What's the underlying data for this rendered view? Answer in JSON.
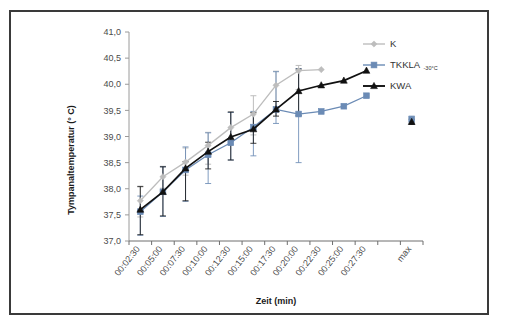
{
  "chart_data": {
    "type": "line",
    "title": "",
    "xlabel": "Zeit (min)",
    "ylabel": "Tympanaltemperatur (° C)",
    "ylim": [
      37.0,
      41.0
    ],
    "ytick_step": 0.5,
    "ytick_labels": [
      "37,0",
      "37,5",
      "38,0",
      "38,5",
      "39,0",
      "39,5",
      "40,0",
      "40,5",
      "41,0"
    ],
    "ytick_values": [
      37.0,
      37.5,
      38.0,
      38.5,
      39.0,
      39.5,
      40.0,
      40.5,
      41.0
    ],
    "categories": [
      "00:02:30",
      "00:05:00",
      "00:07:30",
      "00:10:00",
      "00:12:30",
      "00:15:00",
      "00:17:30",
      "00:20:00",
      "00:22:30",
      "00:25:00",
      "00:27:30",
      "",
      "max"
    ],
    "grid": false,
    "legend_position": "top-right",
    "series": [
      {
        "name": "K",
        "color": "#bdbdbd",
        "marker": "diamond",
        "values": [
          37.77,
          38.23,
          38.51,
          38.83,
          39.17,
          39.43,
          39.98,
          40.26,
          40.28,
          null,
          null,
          null,
          null
        ],
        "err_low": [
          0.31,
          0.22,
          0.25,
          0.36,
          0.33,
          0.4,
          0.52,
          0.36,
          null,
          null,
          null,
          null,
          null
        ],
        "err_high": [
          0.28,
          0.2,
          0.27,
          0.25,
          0.29,
          0.35,
          0.27,
          0.1,
          null,
          null,
          null,
          null,
          null
        ]
      },
      {
        "name": "TKKLA",
        "name_sub": "-30°C",
        "color": "#6b8bb5",
        "marker": "square",
        "values": [
          37.56,
          37.94,
          38.36,
          38.65,
          38.88,
          39.18,
          39.52,
          39.43,
          39.48,
          39.58,
          39.78,
          null,
          39.33
        ],
        "err_low": [
          0.45,
          0.47,
          0.6,
          0.55,
          0.33,
          0.55,
          0.27,
          0.93,
          null,
          null,
          null,
          null,
          0.07
        ],
        "err_high": [
          0.3,
          0.48,
          0.44,
          0.42,
          0.58,
          0.3,
          0.72,
          0.87,
          null,
          null,
          null,
          null,
          0.06
        ]
      },
      {
        "name": "KWA",
        "color": "#111111",
        "marker": "triangle",
        "values": [
          37.6,
          37.94,
          38.39,
          38.71,
          38.99,
          39.14,
          39.52,
          39.87,
          39.98,
          40.07,
          40.26,
          null,
          39.28
        ],
        "err_low": [
          0.48,
          0.46,
          0.62,
          0.33,
          0.44,
          0.27,
          0.13,
          0.47,
          null,
          null,
          null,
          null,
          0.05
        ],
        "err_high": [
          0.44,
          0.48,
          0.13,
          0.18,
          0.48,
          0.32,
          0.15,
          0.42,
          null,
          null,
          null,
          null,
          0.05
        ]
      }
    ]
  },
  "legend": {
    "items": [
      {
        "label": "K",
        "sub": ""
      },
      {
        "label": "TKKLA",
        "sub": "-30°C"
      },
      {
        "label": "KWA",
        "sub": ""
      }
    ]
  },
  "axes": {
    "y_title": "Tympanaltemperatur (° C)",
    "x_title": "Zeit (min)"
  }
}
